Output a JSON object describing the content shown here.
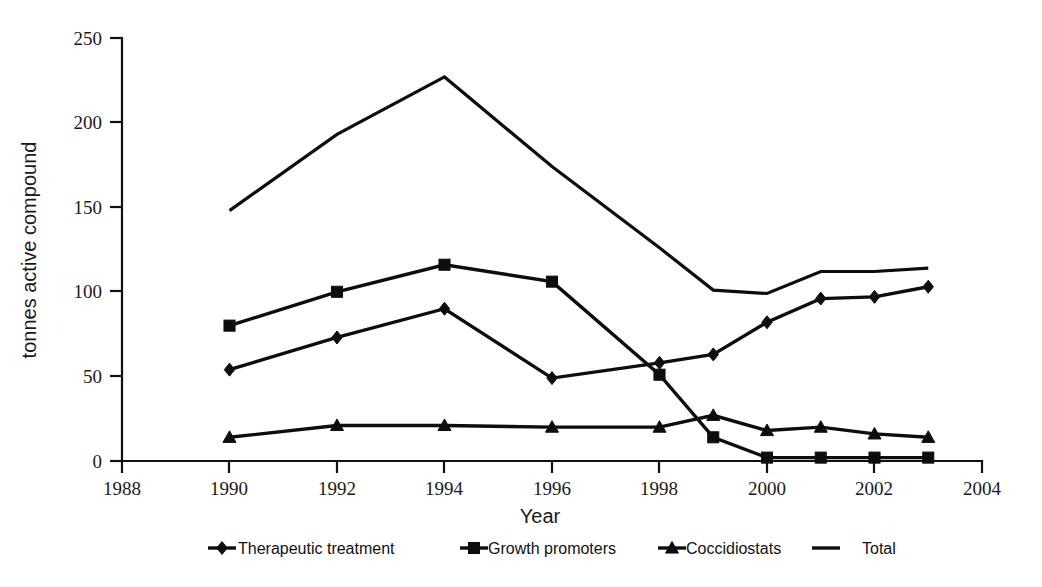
{
  "chart_data": {
    "type": "line",
    "title": "",
    "xlabel": "Year",
    "ylabel": "tonnes active compound",
    "xlim": [
      1988,
      2004
    ],
    "ylim": [
      0,
      250
    ],
    "xticks": [
      1988,
      1990,
      1992,
      1994,
      1996,
      1998,
      2000,
      2002,
      2004
    ],
    "yticks": [
      0,
      50,
      100,
      150,
      200,
      250
    ],
    "grid": false,
    "legend_position": "bottom",
    "x": [
      1990,
      1992,
      1994,
      1996,
      1998,
      1999,
      2000,
      2001,
      2002,
      2003
    ],
    "series": [
      {
        "name": "Therapeutic treatment",
        "marker": "diamond",
        "values": [
          54,
          73,
          90,
          49,
          58,
          63,
          82,
          96,
          97,
          103
        ]
      },
      {
        "name": "Growth promoters",
        "marker": "square",
        "values": [
          80,
          100,
          116,
          106,
          51,
          14,
          2,
          2,
          2,
          2
        ]
      },
      {
        "name": "Coccidiostats",
        "marker": "triangle",
        "values": [
          14,
          21,
          21,
          20,
          20,
          27,
          18,
          20,
          16,
          14
        ]
      },
      {
        "name": "Total",
        "marker": "none",
        "values": [
          148,
          193,
          227,
          174,
          126,
          101,
          99,
          112,
          112,
          114
        ]
      }
    ]
  },
  "axes": {
    "y_title": "tonnes active compound",
    "x_title": "Year",
    "y_tick_labels": [
      "250",
      "200",
      "150",
      "100",
      "50",
      "0"
    ],
    "x_tick_labels": [
      "1988",
      "1990",
      "1992",
      "1994",
      "1996",
      "1998",
      "2000",
      "2002",
      "2004"
    ]
  },
  "legend": {
    "items": [
      {
        "label": "Therapeutic treatment",
        "marker": "diamond-marker-icon"
      },
      {
        "label": "Growth promoters",
        "marker": "square-marker-icon"
      },
      {
        "label": "Coccidiostats",
        "marker": "triangle-marker-icon"
      },
      {
        "label": "Total",
        "marker": "line-marker-icon"
      }
    ]
  },
  "colors": {
    "ink": "#0d0d0d",
    "axis": "#111111",
    "background": "#ffffff"
  }
}
